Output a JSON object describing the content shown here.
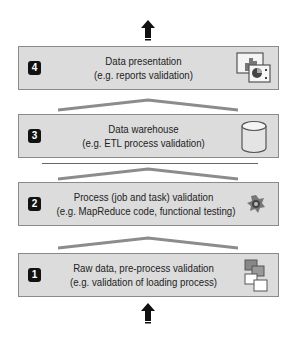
{
  "diagram": {
    "layers": [
      {
        "number": "4",
        "title": "Data presentation",
        "subtitle": "(e.g. reports validation)",
        "icon": "report-chart-icon"
      },
      {
        "number": "3",
        "title": "Data warehouse",
        "subtitle": "(e.g. ETL process validation)",
        "icon": "database-cylinder-icon"
      },
      {
        "number": "2",
        "title": "Process (job and task) validation",
        "subtitle": "(e.g. MapReduce code, functional testing)",
        "icon": "gear-process-icon"
      },
      {
        "number": "1",
        "title": "Raw data, pre-process validation",
        "subtitle": "(e.g. validation of loading process)",
        "icon": "stacked-files-icon"
      }
    ],
    "colors": {
      "box_fill": "#dcdcdc",
      "box_border": "#8a8a8a",
      "roof": "#8c8c8c",
      "badge": "#111111",
      "arrow": "#111111"
    }
  }
}
